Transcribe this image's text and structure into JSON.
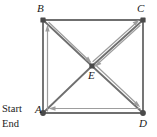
{
  "figure": {
    "canvas": {
      "width": 157,
      "height": 137
    },
    "colors": {
      "edge": "#6b6b6b",
      "path": "#9a9a9a",
      "vertex": "#4a4a4a",
      "text": "#1a1a1a",
      "background": "#ffffff"
    },
    "vertices": [
      {
        "id": "B",
        "label": "B",
        "x": 43,
        "y": 20
      },
      {
        "id": "C",
        "label": "C",
        "x": 143,
        "y": 20
      },
      {
        "id": "E",
        "label": "E",
        "x": 92,
        "y": 66
      },
      {
        "id": "A",
        "label": "A",
        "x": 43,
        "y": 113
      },
      {
        "id": "D",
        "label": "D",
        "x": 143,
        "y": 113
      }
    ],
    "annotations": [
      {
        "id": "start",
        "text": "Start",
        "x": 2,
        "y": 104
      },
      {
        "id": "end",
        "text": "End",
        "x": 2,
        "y": 119
      }
    ],
    "edges": [
      {
        "from": "B",
        "to": "C",
        "kind": "side"
      },
      {
        "from": "A",
        "to": "B",
        "kind": "side"
      },
      {
        "from": "C",
        "to": "D",
        "kind": "side"
      },
      {
        "from": "A",
        "to": "D",
        "kind": "side"
      },
      {
        "from": "B",
        "to": "E",
        "kind": "diagonal"
      },
      {
        "from": "E",
        "to": "C",
        "kind": "diagonal"
      },
      {
        "from": "A",
        "to": "E",
        "kind": "diagonal"
      },
      {
        "from": "E",
        "to": "D",
        "kind": "diagonal"
      }
    ],
    "path": {
      "sequence": [
        "A",
        "B",
        "E",
        "C",
        "E",
        "D",
        "A"
      ],
      "steps": [
        {
          "order": 1,
          "from": "A",
          "to": "B",
          "direction": "up"
        },
        {
          "order": 2,
          "from": "B",
          "to": "E",
          "direction": "down-right"
        },
        {
          "order": 3,
          "from": "E",
          "to": "C",
          "direction": "up-right"
        },
        {
          "order": 4,
          "from": "C",
          "to": "E",
          "direction": "down-left"
        },
        {
          "order": 5,
          "from": "E",
          "to": "D",
          "direction": "down-right"
        },
        {
          "order": 6,
          "from": "D",
          "to": "A",
          "direction": "left"
        }
      ]
    }
  }
}
